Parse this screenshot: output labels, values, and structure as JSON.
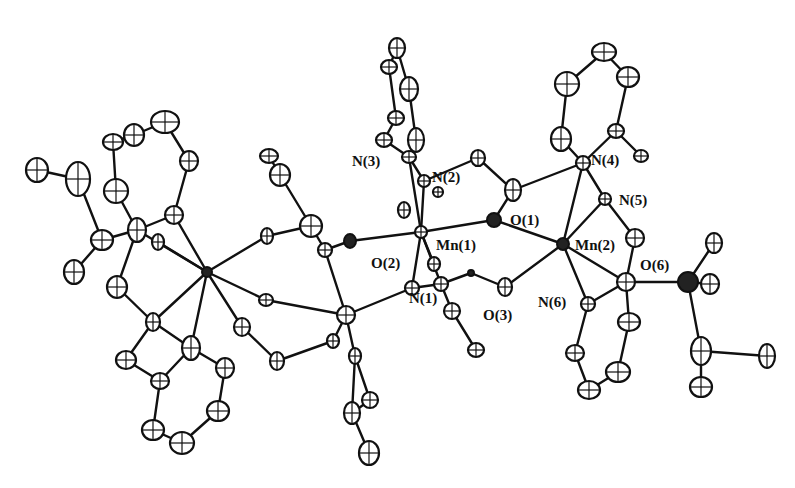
{
  "figure": {
    "type": "ORTEP crystal structure diagram",
    "background": "#ffffff",
    "ink": "#111111"
  },
  "labels": {
    "N3": "N(3)",
    "N2": "N(2)",
    "N4": "N(4)",
    "N5": "N(5)",
    "O1": "O(1)",
    "Mn1": "Mn(1)",
    "Mn2": "Mn(2)",
    "O2": "O(2)",
    "N1": "N(1)",
    "O3": "O(3)",
    "N6": "N(6)",
    "O6": "O(6)"
  },
  "label_positions": {
    "N3": [
      352,
      166
    ],
    "N2": [
      432,
      182
    ],
    "N4": [
      591,
      165
    ],
    "N5": [
      619,
      205
    ],
    "O1": [
      510,
      225
    ],
    "Mn1": [
      436,
      250
    ],
    "Mn2": [
      575,
      250
    ],
    "O2": [
      371,
      268
    ],
    "N1": [
      409,
      303
    ],
    "O3": [
      483,
      320
    ],
    "N6": [
      538,
      307
    ],
    "O6": [
      640,
      270
    ]
  },
  "atoms": [
    {
      "id": "Mn1",
      "x": 421,
      "y": 232,
      "rx": 6,
      "ry": 6,
      "dark": false
    },
    {
      "id": "Mn2",
      "x": 563,
      "y": 244,
      "rx": 6,
      "ry": 6,
      "dark": true
    },
    {
      "id": "MnL",
      "x": 207,
      "y": 272,
      "rx": 5,
      "ry": 5,
      "dark": true
    },
    {
      "id": "N3",
      "x": 409,
      "y": 157,
      "rx": 7,
      "ry": 6
    },
    {
      "id": "N2",
      "x": 424,
      "y": 181,
      "rx": 6,
      "ry": 6
    },
    {
      "id": "O1",
      "x": 494,
      "y": 220,
      "rx": 7,
      "ry": 7,
      "dark": true
    },
    {
      "id": "O2",
      "x": 412,
      "y": 288,
      "rx": 7,
      "ry": 7
    },
    {
      "id": "N1",
      "x": 441,
      "y": 284,
      "rx": 7,
      "ry": 7
    },
    {
      "id": "O3",
      "x": 505,
      "y": 287,
      "rx": 7,
      "ry": 9
    },
    {
      "id": "N4",
      "x": 583,
      "y": 163,
      "rx": 7,
      "ry": 7
    },
    {
      "id": "N5",
      "x": 605,
      "y": 199,
      "rx": 6,
      "ry": 6
    },
    {
      "id": "N6",
      "x": 588,
      "y": 304,
      "rx": 7,
      "ry": 7
    },
    {
      "id": "O6",
      "x": 626,
      "y": 282,
      "rx": 9,
      "ry": 9
    },
    {
      "id": "c1",
      "x": 478,
      "y": 158,
      "rx": 7,
      "ry": 8
    },
    {
      "id": "c2",
      "x": 513,
      "y": 190,
      "rx": 8,
      "ry": 11
    },
    {
      "id": "c3",
      "x": 438,
      "y": 192,
      "rx": 5,
      "ry": 5
    },
    {
      "id": "c4",
      "x": 404,
      "y": 210,
      "rx": 6,
      "ry": 8
    },
    {
      "id": "c5",
      "x": 350,
      "y": 241,
      "rx": 6,
      "ry": 7,
      "dark": true
    },
    {
      "id": "c6",
      "x": 471,
      "y": 273,
      "rx": 3,
      "ry": 3,
      "dark": true
    },
    {
      "id": "c7",
      "x": 452,
      "y": 311,
      "rx": 8,
      "ry": 8
    },
    {
      "id": "c8",
      "x": 476,
      "y": 350,
      "rx": 8,
      "ry": 7
    },
    {
      "id": "c9",
      "x": 434,
      "y": 264,
      "rx": 6,
      "ry": 7
    },
    {
      "id": "p1",
      "x": 397,
      "y": 48,
      "rx": 8,
      "ry": 10
    },
    {
      "id": "p2",
      "x": 389,
      "y": 67,
      "rx": 8,
      "ry": 7
    },
    {
      "id": "p3",
      "x": 409,
      "y": 89,
      "rx": 9,
      "ry": 12
    },
    {
      "id": "p4",
      "x": 396,
      "y": 118,
      "rx": 8,
      "ry": 7
    },
    {
      "id": "p5",
      "x": 384,
      "y": 140,
      "rx": 8,
      "ry": 7
    },
    {
      "id": "p6",
      "x": 416,
      "y": 140,
      "rx": 8,
      "ry": 12
    },
    {
      "id": "q1",
      "x": 604,
      "y": 52,
      "rx": 12,
      "ry": 9
    },
    {
      "id": "q2",
      "x": 567,
      "y": 84,
      "rx": 12,
      "ry": 12
    },
    {
      "id": "q3",
      "x": 628,
      "y": 77,
      "rx": 11,
      "ry": 10
    },
    {
      "id": "q4",
      "x": 561,
      "y": 139,
      "rx": 10,
      "ry": 12
    },
    {
      "id": "q5",
      "x": 616,
      "y": 131,
      "rx": 8,
      "ry": 7
    },
    {
      "id": "q6",
      "x": 641,
      "y": 156,
      "rx": 7,
      "ry": 6
    },
    {
      "id": "q7",
      "x": 635,
      "y": 238,
      "rx": 9,
      "ry": 9
    },
    {
      "id": "r1",
      "x": 714,
      "y": 243,
      "rx": 8,
      "ry": 10
    },
    {
      "id": "r2",
      "x": 688,
      "y": 282,
      "rx": 10,
      "ry": 10,
      "dark": true
    },
    {
      "id": "r3",
      "x": 710,
      "y": 284,
      "rx": 9,
      "ry": 10
    },
    {
      "id": "r4",
      "x": 701,
      "y": 351,
      "rx": 10,
      "ry": 14
    },
    {
      "id": "r5",
      "x": 767,
      "y": 356,
      "rx": 8,
      "ry": 12
    },
    {
      "id": "r6",
      "x": 701,
      "y": 387,
      "rx": 11,
      "ry": 10
    },
    {
      "id": "s1",
      "x": 629,
      "y": 322,
      "rx": 11,
      "ry": 9
    },
    {
      "id": "s2",
      "x": 618,
      "y": 372,
      "rx": 12,
      "ry": 10
    },
    {
      "id": "s3",
      "x": 575,
      "y": 353,
      "rx": 9,
      "ry": 8
    },
    {
      "id": "s4",
      "x": 589,
      "y": 390,
      "rx": 11,
      "ry": 9
    },
    {
      "id": "m1",
      "x": 269,
      "y": 156,
      "rx": 9,
      "ry": 7
    },
    {
      "id": "m2",
      "x": 280,
      "y": 175,
      "rx": 10,
      "ry": 11
    },
    {
      "id": "m3",
      "x": 311,
      "y": 226,
      "rx": 11,
      "ry": 11
    },
    {
      "id": "m4",
      "x": 325,
      "y": 250,
      "rx": 7,
      "ry": 7
    },
    {
      "id": "m5",
      "x": 267,
      "y": 236,
      "rx": 6,
      "ry": 8
    },
    {
      "id": "m6",
      "x": 266,
      "y": 300,
      "rx": 7,
      "ry": 6
    },
    {
      "id": "m7",
      "x": 346,
      "y": 315,
      "rx": 9,
      "ry": 9
    },
    {
      "id": "m8",
      "x": 333,
      "y": 341,
      "rx": 6,
      "ry": 7
    },
    {
      "id": "m9",
      "x": 277,
      "y": 361,
      "rx": 7,
      "ry": 9
    },
    {
      "id": "m10",
      "x": 242,
      "y": 327,
      "rx": 8,
      "ry": 9
    },
    {
      "id": "m11",
      "x": 355,
      "y": 356,
      "rx": 6,
      "ry": 8
    },
    {
      "id": "m12",
      "x": 370,
      "y": 400,
      "rx": 8,
      "ry": 8
    },
    {
      "id": "m13",
      "x": 352,
      "y": 413,
      "rx": 8,
      "ry": 11
    },
    {
      "id": "m14",
      "x": 369,
      "y": 453,
      "rx": 10,
      "ry": 12
    },
    {
      "id": "l1",
      "x": 165,
      "y": 122,
      "rx": 14,
      "ry": 11
    },
    {
      "id": "l2",
      "x": 134,
      "y": 135,
      "rx": 10,
      "ry": 11
    },
    {
      "id": "l3",
      "x": 113,
      "y": 142,
      "rx": 10,
      "ry": 8
    },
    {
      "id": "l4",
      "x": 189,
      "y": 161,
      "rx": 9,
      "ry": 10
    },
    {
      "id": "l5",
      "x": 78,
      "y": 179,
      "rx": 12,
      "ry": 17
    },
    {
      "id": "l6",
      "x": 37,
      "y": 170,
      "rx": 11,
      "ry": 12
    },
    {
      "id": "l7",
      "x": 116,
      "y": 191,
      "rx": 12,
      "ry": 12
    },
    {
      "id": "l8",
      "x": 174,
      "y": 215,
      "rx": 9,
      "ry": 9
    },
    {
      "id": "l9",
      "x": 137,
      "y": 230,
      "rx": 9,
      "ry": 12
    },
    {
      "id": "l10",
      "x": 102,
      "y": 240,
      "rx": 11,
      "ry": 10
    },
    {
      "id": "l11",
      "x": 158,
      "y": 242,
      "rx": 6,
      "ry": 8
    },
    {
      "id": "l12",
      "x": 74,
      "y": 272,
      "rx": 10,
      "ry": 12
    },
    {
      "id": "l13",
      "x": 117,
      "y": 287,
      "rx": 10,
      "ry": 11
    },
    {
      "id": "l14",
      "x": 153,
      "y": 322,
      "rx": 7,
      "ry": 9
    },
    {
      "id": "l15",
      "x": 191,
      "y": 348,
      "rx": 9,
      "ry": 12
    },
    {
      "id": "l16",
      "x": 126,
      "y": 360,
      "rx": 10,
      "ry": 9
    },
    {
      "id": "l17",
      "x": 160,
      "y": 381,
      "rx": 9,
      "ry": 8
    },
    {
      "id": "l18",
      "x": 225,
      "y": 368,
      "rx": 9,
      "ry": 10
    },
    {
      "id": "l19",
      "x": 218,
      "y": 411,
      "rx": 11,
      "ry": 10
    },
    {
      "id": "l20",
      "x": 153,
      "y": 430,
      "rx": 11,
      "ry": 10
    },
    {
      "id": "l21",
      "x": 182,
      "y": 443,
      "rx": 12,
      "ry": 11
    }
  ],
  "bonds": [
    [
      "Mn1",
      "N3"
    ],
    [
      "Mn1",
      "N2"
    ],
    [
      "Mn1",
      "O1"
    ],
    [
      "Mn1",
      "O2"
    ],
    [
      "Mn1",
      "N1"
    ],
    [
      "Mn1",
      "c5"
    ],
    [
      "Mn1",
      "c9"
    ],
    [
      "Mn2",
      "O1"
    ],
    [
      "Mn2",
      "N4"
    ],
    [
      "Mn2",
      "N5"
    ],
    [
      "Mn2",
      "N6"
    ],
    [
      "Mn2",
      "O6"
    ],
    [
      "Mn2",
      "O3"
    ],
    [
      "N3",
      "N2"
    ],
    [
      "N2",
      "c1"
    ],
    [
      "c1",
      "c2"
    ],
    [
      "c2",
      "O1"
    ],
    [
      "c2",
      "N4"
    ],
    [
      "N3",
      "p5"
    ],
    [
      "N3",
      "p6"
    ],
    [
      "p5",
      "p4"
    ],
    [
      "p4",
      "p2"
    ],
    [
      "p2",
      "p1"
    ],
    [
      "p6",
      "p3"
    ],
    [
      "p3",
      "p1"
    ],
    [
      "N4",
      "q4"
    ],
    [
      "q4",
      "q2"
    ],
    [
      "q2",
      "q1"
    ],
    [
      "q1",
      "q3"
    ],
    [
      "q3",
      "q5"
    ],
    [
      "q5",
      "N4"
    ],
    [
      "q5",
      "q6"
    ],
    [
      "N4",
      "N5"
    ],
    [
      "N5",
      "q7"
    ],
    [
      "q7",
      "O6"
    ],
    [
      "O6",
      "r2"
    ],
    [
      "r2",
      "r1"
    ],
    [
      "r2",
      "r3"
    ],
    [
      "r2",
      "r4"
    ],
    [
      "r4",
      "r5"
    ],
    [
      "r4",
      "r6"
    ],
    [
      "N6",
      "O6"
    ],
    [
      "N6",
      "s3"
    ],
    [
      "s3",
      "s4"
    ],
    [
      "s4",
      "s2"
    ],
    [
      "s2",
      "s1"
    ],
    [
      "s1",
      "O6"
    ],
    [
      "N1",
      "c7"
    ],
    [
      "c7",
      "c8"
    ],
    [
      "N1",
      "c6"
    ],
    [
      "c6",
      "O3"
    ],
    [
      "N1",
      "O2"
    ],
    [
      "c5",
      "m4"
    ],
    [
      "O2",
      "m7"
    ],
    [
      "m4",
      "m3"
    ],
    [
      "m3",
      "m2"
    ],
    [
      "m2",
      "m1"
    ],
    [
      "m3",
      "m5"
    ],
    [
      "m5",
      "MnL"
    ],
    [
      "m4",
      "m7"
    ],
    [
      "m7",
      "m8"
    ],
    [
      "m8",
      "m9"
    ],
    [
      "m9",
      "m10"
    ],
    [
      "m10",
      "MnL"
    ],
    [
      "m6",
      "MnL"
    ],
    [
      "m6",
      "m7"
    ],
    [
      "m7",
      "m11"
    ],
    [
      "m11",
      "m12"
    ],
    [
      "m12",
      "m13"
    ],
    [
      "m13",
      "m14"
    ],
    [
      "m11",
      "m13"
    ],
    [
      "MnL",
      "l8"
    ],
    [
      "MnL",
      "l11"
    ],
    [
      "MnL",
      "l14"
    ],
    [
      "MnL",
      "l15"
    ],
    [
      "MnL",
      "l9"
    ],
    [
      "l8",
      "l4"
    ],
    [
      "l4",
      "l1"
    ],
    [
      "l1",
      "l2"
    ],
    [
      "l2",
      "l3"
    ],
    [
      "l3",
      "l7"
    ],
    [
      "l7",
      "l9"
    ],
    [
      "l9",
      "l8"
    ],
    [
      "l9",
      "l10"
    ],
    [
      "l10",
      "l5"
    ],
    [
      "l5",
      "l6"
    ],
    [
      "l10",
      "l12"
    ],
    [
      "l9",
      "l13"
    ],
    [
      "l13",
      "l14"
    ],
    [
      "l14",
      "l16"
    ],
    [
      "l16",
      "l17"
    ],
    [
      "l17",
      "l15"
    ],
    [
      "l14",
      "l15"
    ],
    [
      "l15",
      "l18"
    ],
    [
      "l18",
      "l19"
    ],
    [
      "l19",
      "l21"
    ],
    [
      "l21",
      "l20"
    ],
    [
      "l20",
      "l17"
    ]
  ]
}
